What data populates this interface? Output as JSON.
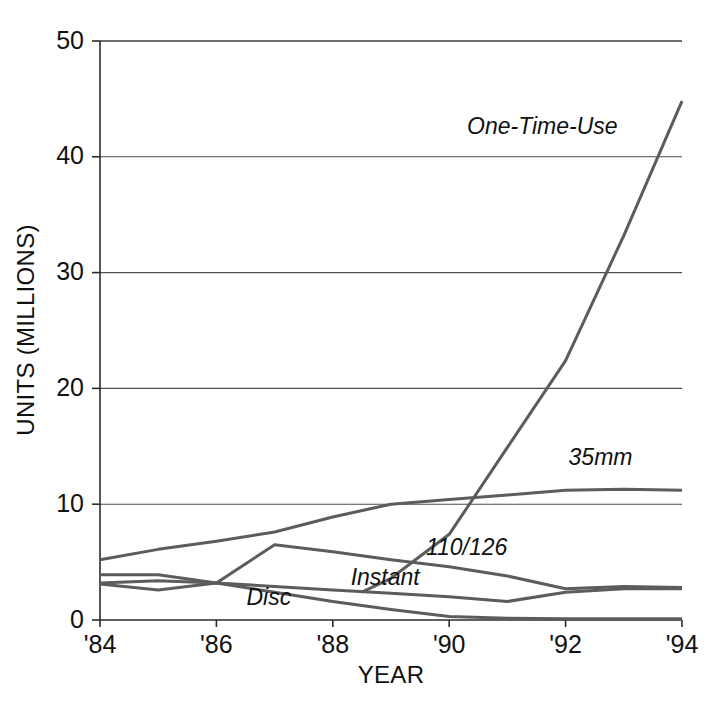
{
  "chart_data": {
    "type": "line",
    "title": "",
    "xlabel": "YEAR",
    "ylabel": "UNITS (MILLIONS)",
    "xlim": [
      1984,
      1994
    ],
    "ylim": [
      0,
      50
    ],
    "grid": true,
    "legend_position": "inline-annotations",
    "x": [
      1984,
      1985,
      1986,
      1987,
      1988,
      1989,
      1990,
      1991,
      1992,
      1993,
      1994
    ],
    "xtick_labels": [
      "'84",
      "'86",
      "'88",
      "'90",
      "'92",
      "'94"
    ],
    "xtick_values": [
      1984,
      1986,
      1988,
      1990,
      1992,
      1994
    ],
    "ytick_labels": [
      "0",
      "10",
      "20",
      "30",
      "40",
      "50"
    ],
    "ytick_values": [
      0,
      10,
      20,
      30,
      40,
      50
    ],
    "series": [
      {
        "name": "35mm",
        "label": "35mm",
        "color": "#5c5c5c",
        "values": [
          5.2,
          6.1,
          6.8,
          7.6,
          8.9,
          10.0,
          10.4,
          10.8,
          11.2,
          11.3,
          11.2
        ]
      },
      {
        "name": "One-Time-Use",
        "label": "One-Time-Use",
        "color": "#5c5c5c",
        "x_start": 1988.5,
        "x": [
          1988.5,
          1989,
          1990,
          1991,
          1992,
          1993,
          1994
        ],
        "values": [
          2.4,
          3.6,
          7.4,
          14.9,
          22.4,
          33.2,
          44.8
        ]
      },
      {
        "name": "110/126",
        "label": "110/126",
        "color": "#5c5c5c",
        "values": [
          3.9,
          3.9,
          3.2,
          6.5,
          5.9,
          5.2,
          4.6,
          3.8,
          2.7,
          2.9,
          2.8
        ]
      },
      {
        "name": "Instant",
        "label": "Instant",
        "color": "#5c5c5c",
        "values": [
          3.1,
          2.6,
          3.2,
          2.9,
          2.6,
          2.3,
          2.0,
          1.6,
          2.4,
          2.7,
          2.7
        ]
      },
      {
        "name": "Disc",
        "label": "Disc",
        "color": "#5c5c5c",
        "values": [
          3.2,
          3.4,
          3.2,
          2.4,
          1.6,
          0.9,
          0.3,
          0.15,
          0.1,
          0.1,
          0.1
        ]
      }
    ],
    "annotations": [
      {
        "text": "One-Time-Use",
        "x": 1991.6,
        "y": 42.0,
        "series": "One-Time-Use"
      },
      {
        "text": "35mm",
        "x": 1992.6,
        "y": 13.4,
        "series": "35mm"
      },
      {
        "text": "110/126",
        "x": 1990.3,
        "y": 5.6,
        "series": "110/126"
      },
      {
        "text": "Instant",
        "x": 1988.9,
        "y": 3.0,
        "series": "Instant"
      },
      {
        "text": "Disc",
        "x": 1986.9,
        "y": 1.3,
        "series": "Disc"
      }
    ]
  }
}
